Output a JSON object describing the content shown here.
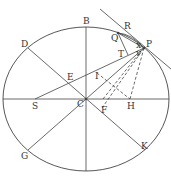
{
  "diagram": {
    "title": "",
    "colors": {
      "stroke": "#444444",
      "label": "#333333"
    },
    "ellipse": {
      "cx": 86,
      "cy": 99,
      "rx": 83,
      "ry": 72
    },
    "points": {
      "B": {
        "x": 86,
        "y": 27,
        "lx": 83,
        "ly": 24,
        "label": "B"
      },
      "R": {
        "x": 125,
        "y": 29,
        "lx": 124,
        "ly": 29,
        "label": "R"
      },
      "Q": {
        "x": 118,
        "y": 33,
        "lx": 111,
        "ly": 41,
        "label": "Q"
      },
      "P": {
        "x": 144,
        "y": 48,
        "lx": 146,
        "ly": 47,
        "label": "P"
      },
      "D": {
        "x": 28,
        "y": 48,
        "lx": 21,
        "ly": 47,
        "label": "D"
      },
      "T": {
        "x": 128,
        "y": 55,
        "lx": 118,
        "ly": 57,
        "label": "T"
      },
      "x": {
        "x": 138,
        "y": 46,
        "lx": 136,
        "ly": 48,
        "label": "x"
      },
      "v": {
        "x": 138,
        "y": 53,
        "lx": 136,
        "ly": 56,
        "label": "v"
      },
      "E": {
        "x": 68,
        "y": 83,
        "lx": 67,
        "ly": 80,
        "label": "E"
      },
      "I": {
        "x": 97,
        "y": 73,
        "lx": 95,
        "ly": 79,
        "label": "I"
      },
      "S": {
        "x": 35,
        "y": 99,
        "lx": 32,
        "ly": 109,
        "label": "S"
      },
      "C": {
        "x": 86,
        "y": 99,
        "lx": 77,
        "ly": 107,
        "label": "C"
      },
      "F": {
        "x": 102,
        "y": 108,
        "lx": 101,
        "ly": 113,
        "label": "F"
      },
      "H": {
        "x": 130,
        "y": 99,
        "lx": 127,
        "ly": 109,
        "label": "H"
      },
      "K": {
        "x": 145,
        "y": 150,
        "lx": 141,
        "ly": 149,
        "label": "K"
      },
      "G": {
        "x": 28,
        "y": 150,
        "lx": 21,
        "ly": 159,
        "label": "G"
      }
    },
    "segments_solid": [
      [
        "B-top",
        86,
        27,
        86,
        171
      ],
      [
        "major-axis",
        3,
        99,
        169,
        99
      ],
      [
        "DK",
        28,
        48,
        145,
        150
      ],
      [
        "GP",
        28,
        150,
        144,
        48
      ],
      [
        "SP",
        35,
        99,
        144,
        48
      ],
      [
        "tangent",
        100,
        9,
        171,
        69
      ],
      [
        "QT",
        118,
        33,
        128,
        55
      ],
      [
        "QP-arc-chord",
        118,
        33,
        144,
        48
      ]
    ],
    "segments_dashed": [
      [
        "IH",
        97,
        73,
        130,
        99
      ],
      [
        "FP",
        102,
        108,
        144,
        48
      ],
      [
        "HP",
        130,
        99,
        144,
        48
      ],
      [
        "IP-dash",
        103,
        99,
        141,
        51
      ]
    ]
  }
}
